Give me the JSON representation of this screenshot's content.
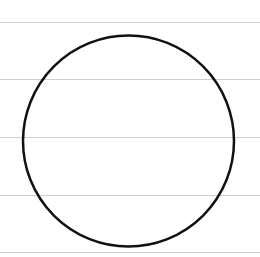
{
  "canvas": {
    "width": 260,
    "height": 257,
    "background": "#ffffff"
  },
  "ruled_lines": {
    "color": "#cfcfcf",
    "y_positions": [
      22,
      79,
      137,
      195,
      252
    ]
  },
  "circle": {
    "cx": 128.5,
    "cy": 141,
    "r": 105.5,
    "stroke": "#111111",
    "stroke_width": 2.5,
    "fill": "none"
  }
}
